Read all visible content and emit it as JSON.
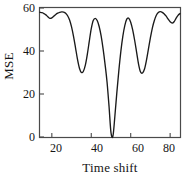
{
  "chart_data": {
    "type": "line",
    "title": "",
    "xlabel": "Time shift",
    "ylabel": "MSE",
    "xlim": [
      14,
      85
    ],
    "ylim": [
      0,
      60
    ],
    "xticks": [
      20,
      40,
      60,
      80
    ],
    "yticks": [
      0,
      20,
      40,
      60
    ],
    "grid": false,
    "legend": null,
    "series": [
      {
        "name": "MSE vs time shift",
        "color": "#1a1a1a",
        "x": [
          14,
          15,
          16,
          17,
          18,
          19,
          20,
          21,
          22,
          23,
          24,
          25,
          26,
          27,
          28,
          29,
          30,
          31,
          32,
          33,
          34,
          35,
          36,
          37,
          38,
          39,
          40,
          41,
          42,
          43,
          44,
          45,
          46,
          47,
          48,
          49,
          50,
          51,
          52,
          53,
          54,
          55,
          56,
          57,
          58,
          59,
          60,
          61,
          62,
          63,
          64,
          65,
          66,
          67,
          68,
          69,
          70,
          71,
          72,
          73,
          74,
          75,
          76,
          77,
          78,
          79,
          80,
          81,
          82,
          83,
          84,
          85
        ],
        "y": [
          58.0,
          57.8,
          57.4,
          56.8,
          55.9,
          55.2,
          55.4,
          56.2,
          57.0,
          57.6,
          58.0,
          58.2,
          58.1,
          57.6,
          56.4,
          54.4,
          51.2,
          46.8,
          41.6,
          36.2,
          32.0,
          30.0,
          30.6,
          33.4,
          38.4,
          44.6,
          50.4,
          54.2,
          55.2,
          54.2,
          51.4,
          47.0,
          41.0,
          33.8,
          25.6,
          14.4,
          2.0,
          0.5,
          10.0,
          21.0,
          31.0,
          39.8,
          46.8,
          51.8,
          54.8,
          55.2,
          53.4,
          49.8,
          45.0,
          39.4,
          33.8,
          30.2,
          29.8,
          31.6,
          35.8,
          41.0,
          46.2,
          50.8,
          54.2,
          56.6,
          57.9,
          58.3,
          58.0,
          57.2,
          56.2,
          54.8,
          53.6,
          53.0,
          53.6,
          55.2,
          56.6,
          57.4
        ]
      }
    ]
  },
  "axes": {
    "y_tick_labels": [
      "60",
      "40",
      "20",
      "0"
    ],
    "x_tick_labels": [
      "20",
      "40",
      "60",
      "80"
    ],
    "ylabel": "MSE",
    "xlabel": "Time shift"
  },
  "style": {
    "line_color": "#1a1a1a",
    "axis_color": "#4a4a4a",
    "background": "#ffffff"
  }
}
